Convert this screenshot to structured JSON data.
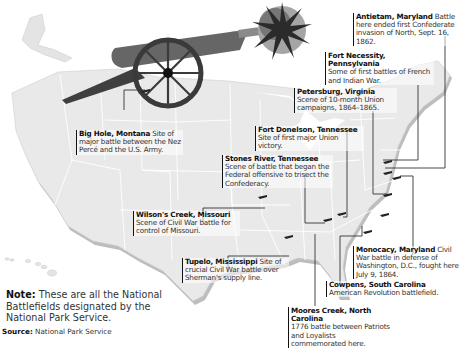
{
  "map": {
    "subject": "United States National Battlefields",
    "colors": {
      "land": "#e9e9e9",
      "state_borders": "#ffffff",
      "shadow": "#bdbdbd",
      "leader_lines": "#444444",
      "cannon": "#555555",
      "explosion": "#333333"
    }
  },
  "battlefields": [
    {
      "name": "Antietam, Maryland",
      "description": "Battle here ended first Confederate invasion of North, Sept. 16, 1862."
    },
    {
      "name": "Fort Necessity, Pennsylvania",
      "description": "Some of first battles of French and Indian War."
    },
    {
      "name": "Petersburg, Virginia",
      "description": "Scene of 10-month Union campaigns, 1864–1865."
    },
    {
      "name": "Fort Donelson, Tennessee",
      "description": "Site of first major Union victory."
    },
    {
      "name": "Big Hole, Montana",
      "description": "Site of major battle between the Nez Percé and the U.S. Army."
    },
    {
      "name": "Stones River, Tennessee",
      "description": "Scene of battle that began the Federal offensive to trisect the Confederacy."
    },
    {
      "name": "Wilson's Creek, Missouri",
      "description": "Scene of Civil War battle for control of Missouri."
    },
    {
      "name": "Tupelo, Mississippi",
      "description": "Site of crucial Civil War battle over Sherman's supply line."
    },
    {
      "name": "Monocacy, Maryland",
      "description": "Civil War battle in defense of Washington, D.C., fought here July 9, 1864."
    },
    {
      "name": "Cowpens, South Carolina",
      "description": "American Revolution battlefield."
    },
    {
      "name": "Moores Creek, North Carolina",
      "description": "1776 battle between Patriots and Loyalists commemorated here."
    }
  ],
  "note": {
    "label": "Note:",
    "text": "These are all the National Battlefields designated by the National Park Service."
  },
  "source": {
    "label": "Source:",
    "text": "National Park Service"
  }
}
